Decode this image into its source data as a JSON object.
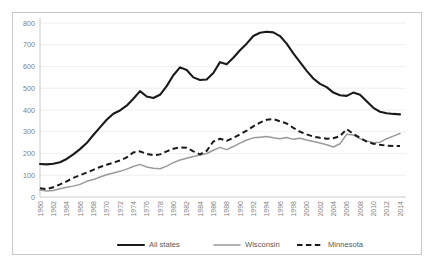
{
  "chart_data": {
    "type": "line",
    "title": "",
    "xlabel": "",
    "ylabel": "",
    "xlim": [
      1960,
      2014
    ],
    "ylim": [
      0,
      800
    ],
    "ytick_step": 100,
    "yticks": [
      "800",
      "700",
      "600",
      "500",
      "400",
      "300",
      "200",
      "100",
      "0"
    ],
    "xticks": [
      "1960",
      "1962",
      "1964",
      "1966",
      "1968",
      "1970",
      "1972",
      "1974",
      "1976",
      "1978",
      "1980",
      "1982",
      "1984",
      "1986",
      "1988",
      "1990",
      "1992",
      "1994",
      "1996",
      "1998",
      "2000",
      "2002",
      "2004",
      "2006",
      "2008",
      "2010",
      "2012",
      "2014"
    ],
    "grid": true,
    "grid_axis": "y",
    "legend_position": "bottom",
    "x": [
      1960,
      1961,
      1962,
      1963,
      1964,
      1965,
      1966,
      1967,
      1968,
      1969,
      1970,
      1971,
      1972,
      1973,
      1974,
      1975,
      1976,
      1977,
      1978,
      1979,
      1980,
      1981,
      1982,
      1983,
      1984,
      1985,
      1986,
      1987,
      1988,
      1989,
      1990,
      1991,
      1992,
      1993,
      1994,
      1995,
      1996,
      1997,
      1998,
      1999,
      2000,
      2001,
      2002,
      2003,
      2004,
      2005,
      2006,
      2007,
      2008,
      2009,
      2010,
      2011,
      2012,
      2013,
      2014
    ],
    "series": [
      {
        "name": "All states",
        "color": "#1a1a1a",
        "style": "solid",
        "width": "thick",
        "values": [
          152,
          150,
          153,
          160,
          175,
          196,
          220,
          248,
          285,
          320,
          355,
          383,
          398,
          420,
          452,
          487,
          462,
          455,
          470,
          510,
          560,
          596,
          584,
          550,
          538,
          540,
          570,
          620,
          610,
          640,
          675,
          705,
          740,
          755,
          760,
          757,
          740,
          705,
          660,
          620,
          580,
          545,
          520,
          505,
          480,
          468,
          465,
          480,
          470,
          440,
          410,
          392,
          385,
          382,
          380
        ]
      },
      {
        "name": "Wisconsin",
        "color": "#9a9a9a",
        "style": "solid",
        "width": "thin",
        "values": [
          32,
          28,
          30,
          38,
          45,
          50,
          58,
          72,
          80,
          92,
          102,
          110,
          118,
          128,
          140,
          150,
          138,
          132,
          130,
          142,
          158,
          170,
          178,
          186,
          193,
          200,
          215,
          228,
          218,
          232,
          248,
          262,
          272,
          275,
          278,
          272,
          268,
          274,
          265,
          270,
          262,
          255,
          248,
          240,
          230,
          245,
          288,
          285,
          268,
          258,
          250,
          252,
          268,
          280,
          292
        ]
      },
      {
        "name": "Minnesota",
        "color": "#1a1a1a",
        "style": "dashed",
        "width": "medium",
        "values": [
          40,
          36,
          45,
          58,
          72,
          88,
          100,
          112,
          125,
          138,
          148,
          158,
          168,
          182,
          205,
          210,
          198,
          192,
          196,
          210,
          222,
          228,
          226,
          210,
          196,
          212,
          255,
          268,
          258,
          272,
          288,
          305,
          325,
          342,
          355,
          358,
          348,
          338,
          318,
          300,
          288,
          278,
          272,
          268,
          270,
          280,
          312,
          290,
          272,
          255,
          245,
          240,
          236,
          235,
          235
        ]
      }
    ]
  },
  "legend": {
    "items": [
      {
        "label": "All states"
      },
      {
        "label": "Wisconsin"
      },
      {
        "label": "Minnesota"
      }
    ]
  }
}
